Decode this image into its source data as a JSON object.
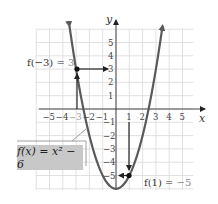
{
  "chart_data": {
    "type": "line",
    "title": "",
    "function_label": "f(x) = x² − 6",
    "xlabel": "x",
    "ylabel": "y",
    "xlim": [
      -6,
      5.8
    ],
    "ylim": [
      -6.1,
      6
    ],
    "grid": true,
    "x_ticks": [
      "-5",
      "-4",
      "-3",
      "-2",
      "-1",
      "1",
      "2",
      "3",
      "4",
      "5"
    ],
    "y_ticks": [
      "5",
      "4",
      "3",
      "2",
      "1",
      "-1",
      "-2",
      "-3",
      "-4",
      "-5"
    ],
    "series": [
      {
        "name": "f(x) = x^2 - 6",
        "x": [
          -3.5,
          -3,
          -2,
          -1,
          0,
          1,
          2,
          3,
          3.5
        ],
        "y": [
          6.25,
          3,
          -2,
          -5,
          -6,
          -5,
          -2,
          3,
          6.25
        ]
      }
    ],
    "points": [
      {
        "x": -3,
        "y": 3,
        "label": "f(−3) = 3"
      },
      {
        "x": 1,
        "y": -5,
        "label": "f(1) = −5"
      }
    ],
    "annotations": [
      {
        "text": "f(−3) = 3",
        "near": [
          -3,
          3
        ]
      },
      {
        "text": "f(1) = −5",
        "near": [
          1,
          -5
        ]
      }
    ]
  },
  "labels": {
    "y_axis": "y",
    "x_axis": "x",
    "fn_box": "f(x) = x² − 6",
    "ann1_lhs": "f(−3) = ",
    "ann1_rhs": "3",
    "ann2_lhs": "f(1) = ",
    "ann2_rhs": "−5"
  },
  "colors": {
    "curve": "#5a5a5a",
    "grid": "#d9d9d9",
    "axis": "#444444",
    "label_box": "#c8c8c8"
  }
}
